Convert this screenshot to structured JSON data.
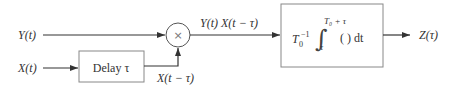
{
  "diagram": {
    "type": "signal-flow block diagram",
    "inputs": {
      "y_input": {
        "label": "Y(t)"
      },
      "x_input": {
        "label": "X(t)"
      }
    },
    "blocks": {
      "delay": {
        "label": "Delay τ"
      },
      "multiplier": {
        "symbol": "×"
      },
      "integrator": {
        "prefix": "T",
        "prefix_sub": "0",
        "prefix_sup": "−1",
        "upper_limit": "T₀ + τ",
        "lower_limit": "τ",
        "body": "(  ) dt"
      }
    },
    "signals": {
      "delayed": {
        "label": "X(t − τ)"
      },
      "product": {
        "label": "Y(t) X(t − τ)"
      },
      "output": {
        "label": "Z(τ)"
      }
    },
    "colors": {
      "line": "#333333",
      "box_border": "#888888",
      "text": "#333333"
    }
  }
}
